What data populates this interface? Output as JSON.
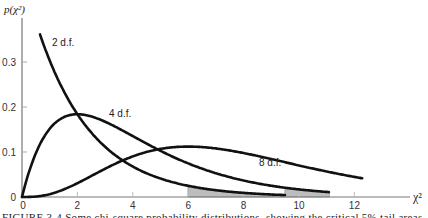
{
  "chart_data": {
    "type": "line",
    "title": "",
    "xlabel": "χ²",
    "ylabel": "p(χ²)",
    "xlim": [
      0,
      13.5
    ],
    "ylim": [
      0,
      0.37
    ],
    "x_ticks": [
      0,
      2,
      4,
      6,
      8,
      10,
      12
    ],
    "y_ticks": [
      0,
      0.1,
      0.2,
      0.3
    ],
    "y_tick_labels": [
      "0",
      "0.1",
      "0.2",
      "0.3"
    ],
    "x_tick_labels": [
      "0",
      "2",
      "4",
      "6",
      "8",
      "10",
      "12"
    ],
    "grid": false,
    "legend": "inline labels",
    "series": [
      {
        "name": "2 d.f.",
        "df": 2,
        "label": "2 d.f.",
        "x_range": [
          0.65,
          9.5
        ],
        "shaded_tail_from": 5.99
      },
      {
        "name": "4 d.f.",
        "df": 4,
        "label": "4 d.f.",
        "x_range": [
          0,
          11.1
        ],
        "shaded_tail_from": 9.49
      },
      {
        "name": "8 d.f.",
        "df": 8,
        "label": "8 d.f.",
        "x_range": [
          0,
          12.3
        ]
      }
    ],
    "annotations": [
      "2 d.f.",
      "4 d.f.",
      "8 d.f."
    ],
    "shaded_regions": [
      {
        "series": "2 d.f.",
        "from": 5.99,
        "to": 9.5,
        "meaning": "critical 5% tail"
      },
      {
        "series": "4 d.f.",
        "from": 9.49,
        "to": 11.1,
        "meaning": "critical 5% tail"
      }
    ]
  },
  "labels": {
    "ylabel": "p(χ²)",
    "xlabel": "χ²",
    "df2": "2 d.f.",
    "df4": "4 d.f.",
    "df8": "8 d.f.",
    "caption": "FIGURE 3-4  Some chi-square probability distributions, showing the critical 5% tail areas"
  },
  "colors": {
    "curve": "#111111",
    "axis": "#777777",
    "shade": "#bdbdbd"
  }
}
